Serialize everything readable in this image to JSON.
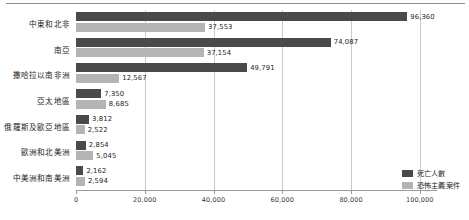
{
  "chart_data": {
    "type": "bar",
    "orientation": "horizontal",
    "title": "",
    "xlabel": "",
    "ylabel": "",
    "xlim": [
      0,
      105000
    ],
    "grid": true,
    "legend_position": "bottom-right",
    "xticks": [
      0,
      20000,
      40000,
      60000,
      80000,
      100000
    ],
    "xtick_labels": [
      "0",
      "20,000",
      "40,000",
      "60,000",
      "80,000",
      "100,000"
    ],
    "categories": [
      "中東和北非",
      "南亞",
      "撒哈拉以南非洲",
      "亞太地區",
      "俄羅斯及歐亞地區",
      "歐洲和北美洲",
      "中美洲和南美洲"
    ],
    "series": [
      {
        "name": "死亡人數",
        "color": "#4a4a4a",
        "values": [
          96360,
          74087,
          49791,
          7350,
          3812,
          2854,
          2162
        ],
        "labels": [
          "96,360",
          "74,087",
          "49,791",
          "7,350",
          "3,812",
          "2,854",
          "2,162"
        ]
      },
      {
        "name": "恐怖主義案件",
        "color": "#b4b4b4",
        "values": [
          37553,
          37154,
          12567,
          8685,
          2522,
          5045,
          2594
        ],
        "labels": [
          "37,553",
          "37,154",
          "12,567",
          "8,685",
          "2,522",
          "5,045",
          "2,594"
        ]
      }
    ]
  },
  "legend": {
    "items": [
      {
        "label": "死亡人數",
        "color": "#4a4a4a"
      },
      {
        "label": "恐怖主義案件",
        "color": "#b4b4b4"
      }
    ]
  }
}
